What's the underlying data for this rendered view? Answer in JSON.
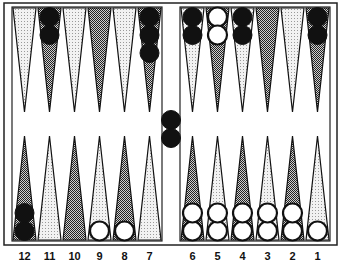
{
  "game": "Backgammon",
  "colors": {
    "frame": "#222222",
    "point_light": "#d8d8d8",
    "point_dark": "#8a8a8a",
    "checker_black": "#111111",
    "checker_white": "#ffffff",
    "background": "#ffffff"
  },
  "point_labels_bottom": [
    "12",
    "11",
    "10",
    "9",
    "8",
    "7",
    "6",
    "5",
    "4",
    "3",
    "2",
    "1"
  ],
  "top_points": [
    {
      "index": 0,
      "shade": "light",
      "checkers": []
    },
    {
      "index": 1,
      "shade": "dark",
      "checkers": [
        "black",
        "black"
      ]
    },
    {
      "index": 2,
      "shade": "light",
      "checkers": []
    },
    {
      "index": 3,
      "shade": "dark",
      "checkers": []
    },
    {
      "index": 4,
      "shade": "light",
      "checkers": []
    },
    {
      "index": 5,
      "shade": "dark",
      "checkers": [
        "black",
        "black",
        "black"
      ]
    },
    {
      "index": 6,
      "shade": "light",
      "checkers": [
        "black",
        "black"
      ]
    },
    {
      "index": 7,
      "shade": "dark",
      "checkers": [
        "white",
        "white"
      ]
    },
    {
      "index": 8,
      "shade": "light",
      "checkers": [
        "black",
        "black"
      ]
    },
    {
      "index": 9,
      "shade": "dark",
      "checkers": []
    },
    {
      "index": 10,
      "shade": "light",
      "checkers": []
    },
    {
      "index": 11,
      "shade": "dark",
      "checkers": [
        "black",
        "black"
      ]
    }
  ],
  "bottom_points": [
    {
      "label": "12",
      "shade": "dark",
      "checkers": [
        "black",
        "black"
      ]
    },
    {
      "label": "11",
      "shade": "light",
      "checkers": []
    },
    {
      "label": "10",
      "shade": "dark",
      "checkers": []
    },
    {
      "label": "9",
      "shade": "light",
      "checkers": [
        "white"
      ]
    },
    {
      "label": "8",
      "shade": "dark",
      "checkers": [
        "white"
      ]
    },
    {
      "label": "7",
      "shade": "light",
      "checkers": []
    },
    {
      "label": "6",
      "shade": "dark",
      "checkers": [
        "white",
        "white"
      ]
    },
    {
      "label": "5",
      "shade": "light",
      "checkers": [
        "white",
        "white"
      ]
    },
    {
      "label": "4",
      "shade": "dark",
      "checkers": [
        "white",
        "white"
      ]
    },
    {
      "label": "3",
      "shade": "light",
      "checkers": [
        "white",
        "white"
      ]
    },
    {
      "label": "2",
      "shade": "dark",
      "checkers": [
        "white",
        "white"
      ]
    },
    {
      "label": "1",
      "shade": "light",
      "checkers": [
        "white"
      ]
    }
  ],
  "bar": {
    "checkers": [
      "black",
      "black"
    ]
  }
}
